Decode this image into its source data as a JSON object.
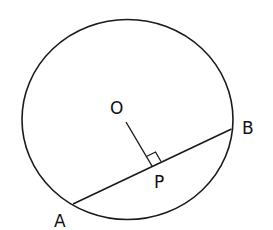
{
  "diagram": {
    "labels": {
      "center": "O",
      "foot": "P",
      "chord_start": "A",
      "chord_end": "B"
    },
    "stroke_color": "#1a1a1a",
    "background": "#ffffff"
  }
}
